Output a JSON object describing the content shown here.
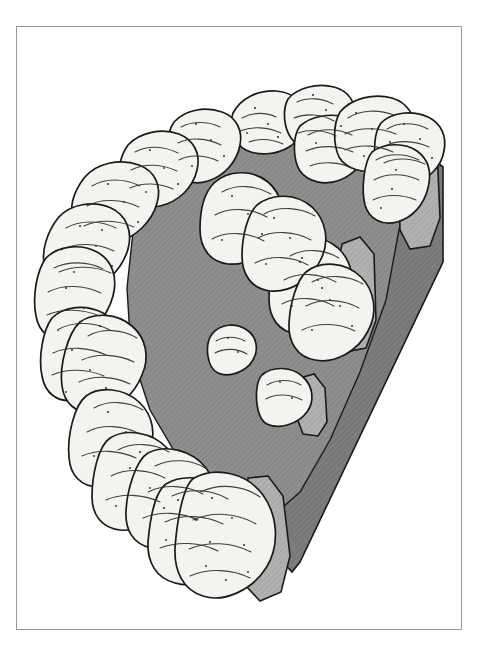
{
  "figure": {
    "caption": "",
    "style": "pen-and-ink archaeological reconstruction drawing",
    "background_color": "#ffffff"
  },
  "frame": {
    "name": "plate-border",
    "stroke_color": "#9a9a9a",
    "stroke_width": 1,
    "x": 16,
    "y": 26,
    "width": 446,
    "height": 604
  },
  "palette": {
    "paper": "#ffffff",
    "stone_fill": "#f2f2ef",
    "stone_shadow": "#e3e3df",
    "outline": "#1a1a1a",
    "plateau_gray": "#8e8e8e",
    "plateau_gray_light": "#9c9c9c",
    "cut_face_light": "#b0b0b0",
    "cut_wall_dark": "#7b7b7b",
    "hatch_line": "#7a7a7a"
  },
  "scene": {
    "elements": [
      {
        "id": "plateau",
        "label": "Inner cairn surface",
        "tone": "plateau_gray",
        "interactable": false
      },
      {
        "id": "cut-wall",
        "label": "Cut-away vertical section face",
        "tone": "cut_wall_dark",
        "interactable": false
      },
      {
        "id": "kerb-ring",
        "label": "Ring of kerbstones",
        "tone": "stone_fill",
        "count": 19,
        "interactable": false
      },
      {
        "id": "sectioned-stones",
        "label": "Stones sliced by the cut plane",
        "tone": "cut_face_light",
        "count": 4,
        "interactable": false
      },
      {
        "id": "inner-stones",
        "label": "Loose stones on the cairn surface",
        "tone": "stone_fill",
        "count": 2,
        "interactable": false
      }
    ],
    "cut_direction": "right-hand side removed, revealing section",
    "viewpoint": "elevated three-quarter / isometric from the north-west"
  },
  "stones": {
    "ring_labels": [
      "kerbstone-01",
      "kerbstone-02",
      "kerbstone-03",
      "kerbstone-04",
      "kerbstone-05",
      "kerbstone-06",
      "kerbstone-07",
      "kerbstone-08",
      "kerbstone-09",
      "kerbstone-10",
      "kerbstone-11",
      "kerbstone-12",
      "kerbstone-13",
      "kerbstone-14",
      "kerbstone-15",
      "kerbstone-16",
      "kerbstone-17",
      "kerbstone-18",
      "kerbstone-19"
    ],
    "inner_labels": [
      "inner-stone-a",
      "inner-stone-b"
    ]
  }
}
